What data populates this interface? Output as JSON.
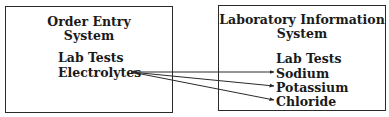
{
  "left_box": {
    "title_line1": "Order Entry",
    "title_line2": "System",
    "subhead": "Lab Tests",
    "items": [
      "Electrolytes"
    ]
  },
  "right_box": {
    "title_line1": "Laboratory Information",
    "title_line2": "System",
    "subhead": "Lab Tests",
    "items": [
      "Sodium",
      "Potassium",
      "Chloride"
    ]
  },
  "connections": [
    {
      "from": "Electrolytes",
      "to": "Sodium",
      "arrowheads": "both"
    },
    {
      "from": "Electrolytes",
      "to": "Potassium",
      "arrowheads": "both"
    },
    {
      "from": "Electrolytes",
      "to": "Chloride",
      "arrowheads": "both"
    }
  ],
  "colors": {
    "line": "#2a2a2a",
    "text": "#1a1a1a",
    "background": "#ffffff"
  }
}
